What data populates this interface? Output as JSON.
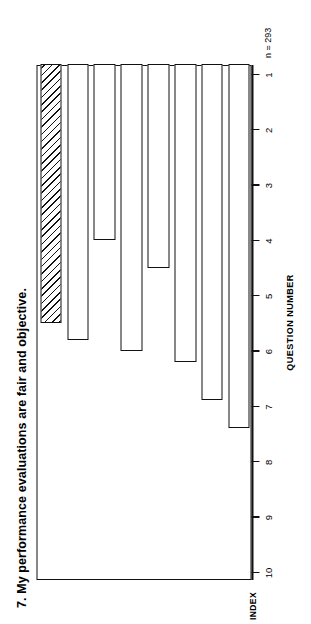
{
  "chart_data": {
    "type": "bar",
    "orientation": "horizontal",
    "title": "7. My performance evaluations are fair and objective.",
    "xlabel": "INDEX",
    "ylabel": "QUESTION NUMBER",
    "sample_note": "n = 293",
    "xlim": [
      10,
      1
    ],
    "xticks": [
      "10",
      "9",
      "8",
      "7",
      "6",
      "5",
      "4",
      "3",
      "2",
      "1"
    ],
    "xtick_values": [
      10,
      9,
      8,
      7,
      6,
      5,
      4,
      3,
      2,
      1
    ],
    "grid": false,
    "legend": false,
    "bar_fill": "#ffffff",
    "bar_edge": "#111111",
    "hatch_pattern": "diagonal-lines",
    "categories": [
      "1",
      "2",
      "3",
      "4",
      "5",
      "6",
      "7",
      "COMPOSITE\nSATISFACTION"
    ],
    "values": [
      7.4,
      6.9,
      6.2,
      4.5,
      6.0,
      4.0,
      5.8,
      5.5
    ],
    "highlight_index": 7,
    "bars": [
      {
        "label": "1",
        "value": 7.4,
        "hatched": false
      },
      {
        "label": "2",
        "value": 6.9,
        "hatched": false
      },
      {
        "label": "3",
        "value": 6.2,
        "hatched": false
      },
      {
        "label": "4",
        "value": 4.5,
        "hatched": false
      },
      {
        "label": "5",
        "value": 6.0,
        "hatched": false
      },
      {
        "label": "6",
        "value": 4.0,
        "hatched": false
      },
      {
        "label": "7",
        "value": 5.8,
        "hatched": false
      },
      {
        "label": "COMPOSITE\nSATISFACTION",
        "value": 5.5,
        "hatched": true
      }
    ]
  }
}
